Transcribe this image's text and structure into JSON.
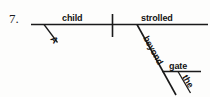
{
  "exercise": {
    "number": "7."
  },
  "diagram": {
    "type": "reed-kellogg-sentence-diagram",
    "sentence": "A child strolled beyond the gate.",
    "ink_color": "#1a1a1a",
    "background_color": "#fdfdfc",
    "words": {
      "subject": "child",
      "subject_article": "A",
      "verb": "strolled",
      "preposition": "beyond",
      "object_of_preposition": "gate",
      "object_article": "the"
    }
  }
}
